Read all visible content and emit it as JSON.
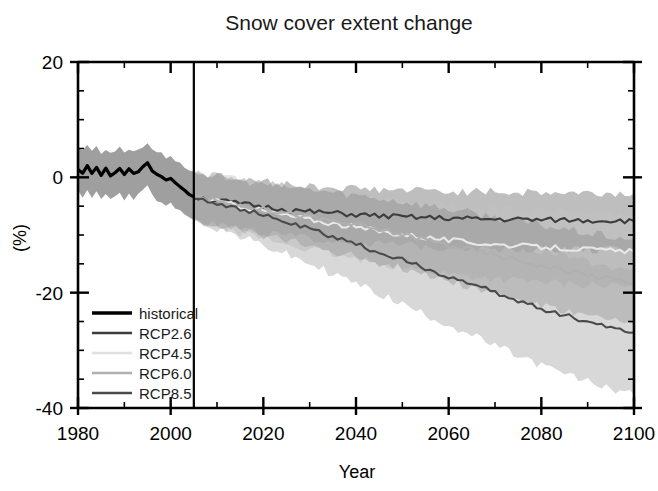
{
  "chart_data": {
    "type": "line",
    "title": "Snow cover extent change",
    "xlabel": "Year",
    "ylabel": "(%)",
    "xlim": [
      1980,
      2100
    ],
    "ylim": [
      -40,
      20
    ],
    "xticks": [
      1980,
      2000,
      2020,
      2040,
      2060,
      2080,
      2100
    ],
    "yticks": [
      20,
      0,
      -20,
      -40
    ],
    "xtick_labels": [
      "1980",
      "2000",
      "2020",
      "2040",
      "2060",
      "2080",
      "2100"
    ],
    "ytick_labels": [
      "20",
      "0",
      "-20",
      "-40"
    ],
    "x_minor_step": 10,
    "y_minor_step": 5,
    "grid": false,
    "legend_position": "lower-left",
    "annotations": [
      {
        "type": "vline",
        "x": 2005,
        "label": "historical / projection divider"
      }
    ],
    "series": [
      {
        "name": "historical",
        "color": "#000000",
        "band_color": "#9a9a9a",
        "x": [
          1980,
          1981,
          1982,
          1983,
          1984,
          1985,
          1986,
          1987,
          1988,
          1989,
          1990,
          1991,
          1992,
          1993,
          1994,
          1995,
          1996,
          1997,
          1998,
          1999,
          2000,
          2001,
          2002,
          2003,
          2004,
          2005
        ],
        "values": [
          1.4,
          0.6,
          1.9,
          0.9,
          1.5,
          0.2,
          1.4,
          0.4,
          0.9,
          1.6,
          0.3,
          1.4,
          0.5,
          1.0,
          1.9,
          2.4,
          1.3,
          0.4,
          0.1,
          -0.5,
          -0.1,
          -1.0,
          -1.4,
          -2.2,
          -2.9,
          -3.4
        ],
        "band_low": [
          -2.4,
          -3.3,
          -2.1,
          -3.4,
          -2.6,
          -3.9,
          -2.7,
          -3.8,
          -3.2,
          -2.5,
          -4.2,
          -2.8,
          -4.0,
          -3.1,
          -2.3,
          -1.6,
          -2.9,
          -4.1,
          -4.3,
          -5.0,
          -4.6,
          -5.5,
          -5.9,
          -6.6,
          -7.1,
          -7.4
        ],
        "band_high": [
          5.0,
          4.5,
          5.6,
          4.8,
          5.2,
          4.2,
          5.0,
          4.3,
          4.6,
          5.2,
          4.1,
          5.0,
          4.4,
          4.7,
          5.4,
          6.0,
          5.0,
          4.3,
          4.1,
          3.5,
          3.9,
          3.0,
          2.6,
          1.9,
          1.4,
          1.0
        ]
      },
      {
        "name": "RCP2.6",
        "color": "#3c3c3c",
        "band_color": "#6e6e6e",
        "x": [
          2005,
          2010,
          2015,
          2020,
          2025,
          2030,
          2035,
          2040,
          2045,
          2050,
          2055,
          2060,
          2065,
          2070,
          2075,
          2080,
          2085,
          2090,
          2095,
          2100
        ],
        "values": [
          -3.4,
          -4.0,
          -4.6,
          -5.1,
          -5.6,
          -6.0,
          -6.2,
          -6.5,
          -6.7,
          -6.9,
          -7.0,
          -7.1,
          -7.2,
          -7.3,
          -7.3,
          -7.4,
          -7.4,
          -7.5,
          -7.5,
          -7.6
        ],
        "band_low": [
          -7.4,
          -8.2,
          -9.0,
          -9.6,
          -10.2,
          -10.7,
          -11.0,
          -11.3,
          -11.6,
          -11.8,
          -12.0,
          -12.1,
          -12.2,
          -12.3,
          -12.4,
          -12.5,
          -12.5,
          -12.6,
          -12.6,
          -12.7
        ],
        "band_high": [
          1.0,
          0.2,
          -0.4,
          -0.8,
          -1.2,
          -1.5,
          -1.7,
          -1.9,
          -2.1,
          -2.2,
          -2.3,
          -2.4,
          -2.5,
          -2.5,
          -2.6,
          -2.6,
          -2.7,
          -2.7,
          -2.8,
          -2.8
        ]
      },
      {
        "name": "RCP4.5",
        "color": "#e8e8e8",
        "band_color": "#c4c4c4",
        "x": [
          2005,
          2010,
          2015,
          2020,
          2025,
          2030,
          2035,
          2040,
          2045,
          2050,
          2055,
          2060,
          2065,
          2070,
          2075,
          2080,
          2085,
          2090,
          2095,
          2100
        ],
        "values": [
          -3.4,
          -4.2,
          -5.0,
          -5.8,
          -6.6,
          -7.3,
          -8.0,
          -8.7,
          -9.3,
          -9.9,
          -10.4,
          -10.9,
          -11.3,
          -11.6,
          -11.9,
          -12.1,
          -12.3,
          -12.5,
          -12.7,
          -12.9
        ],
        "band_low": [
          -7.4,
          -8.5,
          -9.6,
          -10.6,
          -11.6,
          -12.5,
          -13.4,
          -14.2,
          -14.9,
          -15.6,
          -16.2,
          -16.7,
          -17.2,
          -17.6,
          -17.9,
          -18.2,
          -18.4,
          -18.6,
          -18.8,
          -19.0
        ],
        "band_high": [
          1.0,
          0.1,
          -0.6,
          -1.3,
          -1.9,
          -2.4,
          -2.9,
          -3.4,
          -3.8,
          -4.2,
          -4.5,
          -4.8,
          -5.1,
          -5.3,
          -5.5,
          -5.7,
          -5.9,
          -6.0,
          -6.2,
          -6.3
        ]
      },
      {
        "name": "RCP6.0",
        "color": "#b0b0b0",
        "band_color": "#8e8e8e",
        "x": [
          2005,
          2010,
          2015,
          2020,
          2025,
          2030,
          2035,
          2040,
          2045,
          2050,
          2055,
          2060,
          2065,
          2070,
          2075,
          2080,
          2085,
          2090,
          2095,
          2100
        ],
        "values": [
          -3.4,
          -4.1,
          -4.8,
          -5.5,
          -6.2,
          -6.9,
          -7.6,
          -8.3,
          -9.1,
          -9.9,
          -10.8,
          -11.7,
          -12.6,
          -13.5,
          -14.4,
          -15.3,
          -16.1,
          -16.9,
          -17.6,
          -18.2
        ],
        "band_low": [
          -7.4,
          -8.3,
          -9.2,
          -10.1,
          -11.0,
          -11.9,
          -12.8,
          -13.7,
          -14.7,
          -15.7,
          -16.8,
          -17.9,
          -19.0,
          -20.1,
          -21.2,
          -22.3,
          -23.2,
          -24.1,
          -24.9,
          -25.6
        ],
        "band_high": [
          1.0,
          0.1,
          -0.5,
          -1.1,
          -1.6,
          -2.1,
          -2.6,
          -3.1,
          -3.6,
          -4.2,
          -4.8,
          -5.5,
          -6.2,
          -6.9,
          -7.6,
          -8.3,
          -9.0,
          -9.7,
          -10.3,
          -10.8
        ]
      },
      {
        "name": "RCP8.5",
        "color": "#4a4a4a",
        "band_color": "#a8a8a8",
        "x": [
          2005,
          2010,
          2015,
          2020,
          2025,
          2030,
          2035,
          2040,
          2045,
          2050,
          2055,
          2060,
          2065,
          2070,
          2075,
          2080,
          2085,
          2090,
          2095,
          2100
        ],
        "values": [
          -3.4,
          -4.4,
          -5.5,
          -6.6,
          -7.8,
          -9.0,
          -10.3,
          -11.6,
          -13.0,
          -14.4,
          -15.8,
          -17.2,
          -18.6,
          -20.0,
          -21.4,
          -22.7,
          -23.9,
          -25.0,
          -26.0,
          -26.9
        ],
        "band_low": [
          -7.4,
          -8.8,
          -10.3,
          -11.8,
          -13.4,
          -15.0,
          -16.7,
          -18.4,
          -20.2,
          -22.0,
          -23.8,
          -25.6,
          -27.4,
          -29.2,
          -31.0,
          -32.6,
          -34.1,
          -35.4,
          -36.6,
          -37.6
        ],
        "band_high": [
          1.0,
          0.0,
          -0.8,
          -1.6,
          -2.4,
          -3.2,
          -4.0,
          -4.9,
          -5.8,
          -6.8,
          -7.8,
          -8.8,
          -9.8,
          -10.8,
          -11.8,
          -12.8,
          -13.7,
          -14.6,
          -15.4,
          -16.2
        ]
      }
    ],
    "legend": [
      {
        "label": "historical",
        "color": "#000000"
      },
      {
        "label": "RCP2.6",
        "color": "#3c3c3c"
      },
      {
        "label": "RCP4.5",
        "color": "#e0e0e0"
      },
      {
        "label": "RCP6.0",
        "color": "#b0b0b0"
      },
      {
        "label": "RCP8.5",
        "color": "#4a4a4a"
      }
    ]
  }
}
